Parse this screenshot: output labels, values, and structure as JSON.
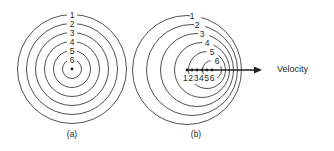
{
  "figure": {
    "background_color": "#ffffff",
    "stroke_color": "#3f3c3b",
    "text_color": "#231f20",
    "width": 334,
    "height": 151
  },
  "panel_a": {
    "caption": "(a)",
    "caption_x": 72,
    "caption_y": 135,
    "description": "stationary source, concentric circular wavefronts",
    "center": {
      "x": 72,
      "y": 69
    },
    "source_dot": {
      "cx": 72,
      "cy": 69,
      "r": 1.4
    },
    "ring_labels": [
      "1",
      "2",
      "3",
      "4",
      "5",
      "6"
    ],
    "rings": [
      {
        "label": "1",
        "cx": 72,
        "cy": 69,
        "r": 54.5,
        "label_x": 72,
        "label_y": 15.5
      },
      {
        "label": "2",
        "cx": 72,
        "cy": 69,
        "r": 45.5,
        "label_x": 72,
        "label_y": 24.5
      },
      {
        "label": "3",
        "cx": 72,
        "cy": 69,
        "r": 36.5,
        "label_x": 72,
        "label_y": 33.5
      },
      {
        "label": "4",
        "cx": 72,
        "cy": 69,
        "r": 27.5,
        "label_x": 72,
        "label_y": 42.5
      },
      {
        "label": "5",
        "cx": 72,
        "cy": 69,
        "r": 18.5,
        "label_x": 72,
        "label_y": 51.5
      },
      {
        "label": "6",
        "cx": 72,
        "cy": 69,
        "r": 9.5,
        "label_x": 72,
        "label_y": 60.5
      }
    ]
  },
  "panel_b": {
    "caption": "(b)",
    "caption_x": 196,
    "caption_y": 135,
    "description": "moving source, wavefronts compressed ahead of motion",
    "ring_labels": [
      "1",
      "2",
      "3",
      "4",
      "5",
      "6"
    ],
    "rings": [
      {
        "label": "1",
        "cx": 187,
        "cy": 70,
        "r": 54.5,
        "label_x": 192,
        "label_y": 16.5
      },
      {
        "label": "2",
        "cx": 192,
        "cy": 70,
        "r": 45.5,
        "label_x": 197,
        "label_y": 25.5
      },
      {
        "label": "3",
        "cx": 197,
        "cy": 70,
        "r": 36.5,
        "label_x": 202,
        "label_y": 34.5
      },
      {
        "label": "4",
        "cx": 202,
        "cy": 70,
        "r": 27.5,
        "label_x": 207,
        "label_y": 43.5
      },
      {
        "label": "5",
        "cx": 207,
        "cy": 70,
        "r": 18.5,
        "label_x": 212,
        "label_y": 52.5
      },
      {
        "label": "6",
        "cx": 212,
        "cy": 70,
        "r": 9.5,
        "label_x": 217,
        "label_y": 61.5
      }
    ],
    "source_positions": [
      {
        "label": "1",
        "cx": 187,
        "cy": 70
      },
      {
        "label": "2",
        "cx": 192,
        "cy": 70
      },
      {
        "label": "3",
        "cx": 197,
        "cy": 70
      },
      {
        "label": "4",
        "cx": 202,
        "cy": 70
      },
      {
        "label": "5",
        "cx": 207,
        "cy": 70
      },
      {
        "label": "6",
        "cx": 212,
        "cy": 70
      }
    ],
    "position_label_row": {
      "text": "123456",
      "x": 199,
      "y": 79
    },
    "velocity_arrow": {
      "x1": 187,
      "y1": 70,
      "x2": 262,
      "y2": 70
    },
    "velocity_label": {
      "text": "Velocity",
      "x": 277,
      "y": 70
    }
  }
}
